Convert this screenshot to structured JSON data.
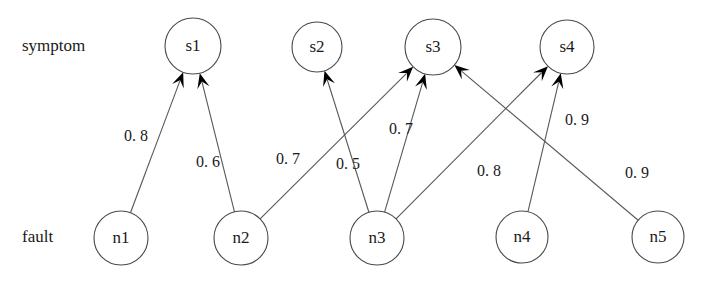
{
  "figure": {
    "title": "",
    "row_labels": {
      "top": "symptom",
      "bottom": "fault"
    }
  },
  "chart_data": {
    "type": "diagram",
    "title": "",
    "xlabel": "",
    "ylabel": "",
    "layout": "bipartite-directed-graph",
    "direction": "fault-to-symptom",
    "colors": {
      "background": "#ffffff",
      "node_stroke": "#4a4a4a",
      "node_fill": "#ffffff",
      "edge": "#585858",
      "arrow": "#000000",
      "text": "#1a1a1a"
    },
    "groups": [
      {
        "id": "symptom",
        "label": "symptom",
        "label_x": 22,
        "label_y": 47
      },
      {
        "id": "fault",
        "label": "fault",
        "label_x": 22,
        "label_y": 238
      }
    ],
    "nodes": [
      {
        "id": "s1",
        "label": "s1",
        "group": "symptom",
        "cx": 193,
        "cy": 46,
        "r": 28
      },
      {
        "id": "s2",
        "label": "s2",
        "group": "symptom",
        "cx": 317,
        "cy": 47,
        "r": 25
      },
      {
        "id": "s3",
        "label": "s3",
        "group": "symptom",
        "cx": 433,
        "cy": 47,
        "r": 28
      },
      {
        "id": "s4",
        "label": "s4",
        "group": "symptom",
        "cx": 567,
        "cy": 47,
        "r": 27
      },
      {
        "id": "n1",
        "label": "n1",
        "group": "fault",
        "cx": 121,
        "cy": 238,
        "r": 27
      },
      {
        "id": "n2",
        "label": "n2",
        "group": "fault",
        "cx": 241,
        "cy": 238,
        "r": 27
      },
      {
        "id": "n3",
        "label": "n3",
        "group": "fault",
        "cx": 377,
        "cy": 238,
        "r": 27
      },
      {
        "id": "n4",
        "label": "n4",
        "group": "fault",
        "cx": 522,
        "cy": 237,
        "r": 26
      },
      {
        "id": "n5",
        "label": "n5",
        "group": "fault",
        "cx": 658,
        "cy": 237,
        "r": 26
      }
    ],
    "edges": [
      {
        "from": "n1",
        "to": "s1",
        "weight": "0. 8",
        "value": 0.8,
        "label_x": 136,
        "label_y": 137
      },
      {
        "from": "n2",
        "to": "s1",
        "weight": "0. 6",
        "value": 0.6,
        "label_x": 208,
        "label_y": 163
      },
      {
        "from": "n2",
        "to": "s3",
        "weight": "0. 7",
        "value": 0.7,
        "label_x": 288,
        "label_y": 160
      },
      {
        "from": "n3",
        "to": "s2",
        "weight": "0. 5",
        "value": 0.5,
        "label_x": 348,
        "label_y": 165
      },
      {
        "from": "n3",
        "to": "s3",
        "weight": "0. 7",
        "value": 0.7,
        "label_x": 401,
        "label_y": 130
      },
      {
        "from": "n3",
        "to": "s4",
        "weight": "0. 8",
        "value": 0.8,
        "label_x": 489,
        "label_y": 172
      },
      {
        "from": "n4",
        "to": "s4",
        "weight": "0. 9",
        "value": 0.9,
        "label_x": 577,
        "label_y": 121
      },
      {
        "from": "n5",
        "to": "s3",
        "weight": "0. 9",
        "value": 0.9,
        "label_x": 637,
        "label_y": 174
      }
    ]
  }
}
